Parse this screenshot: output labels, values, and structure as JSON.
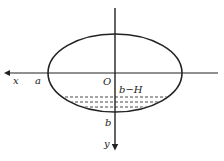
{
  "diagram": {
    "type": "ellipse-coordinate-figure",
    "ellipse": {
      "cx": 115,
      "cy": 73,
      "rx": 67,
      "ry": 39
    },
    "axes": {
      "x": {
        "label": "x",
        "direction": "left"
      },
      "y": {
        "label": "y",
        "direction": "down"
      }
    },
    "labels": {
      "origin": "O",
      "a": "a",
      "b": "b",
      "b_minus_H": "b−H"
    },
    "dashed_levels": [
      97,
      102,
      107
    ],
    "colors": {
      "stroke": "#222222",
      "background": "#ffffff"
    }
  }
}
